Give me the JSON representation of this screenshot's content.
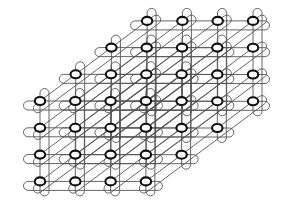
{
  "diagram": {
    "title": "",
    "type": "3D torus network topology",
    "dimensions": [
      4,
      4,
      4
    ],
    "colors": {
      "background": "#ffffff",
      "node_stroke": "#111111",
      "link_stroke": "#555555"
    },
    "geometry": {
      "front_origin": [
        40,
        101
      ],
      "x_step": 35.3,
      "y_step": 26.8,
      "depth_step": [
        35.7,
        -26.7
      ],
      "node_rx": 5.2,
      "node_ry": 4.0,
      "loop_radius": 4.5
    }
  }
}
